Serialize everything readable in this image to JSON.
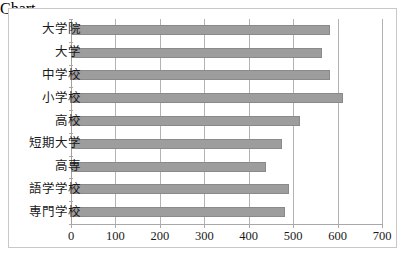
{
  "chart_data": {
    "type": "bar",
    "orientation": "horizontal",
    "title": "",
    "xlabel": "",
    "ylabel": "",
    "xlim": [
      0,
      700
    ],
    "xticks": [
      0,
      100,
      200,
      300,
      400,
      500,
      600,
      700
    ],
    "grid": true,
    "legend": false,
    "bar_color": "#9d9d9d",
    "bar_edge_color": "#8a8a8a",
    "grid_color": "#b3b3b3",
    "frame_color": "#c8c8c8",
    "categories": [
      "大学院",
      "大学",
      "中学校",
      "小学校",
      "高校",
      "短期大学",
      "高専",
      "語学学校",
      "専門学校"
    ],
    "values": [
      582,
      566,
      582,
      612,
      516,
      474,
      440,
      490,
      482
    ]
  }
}
